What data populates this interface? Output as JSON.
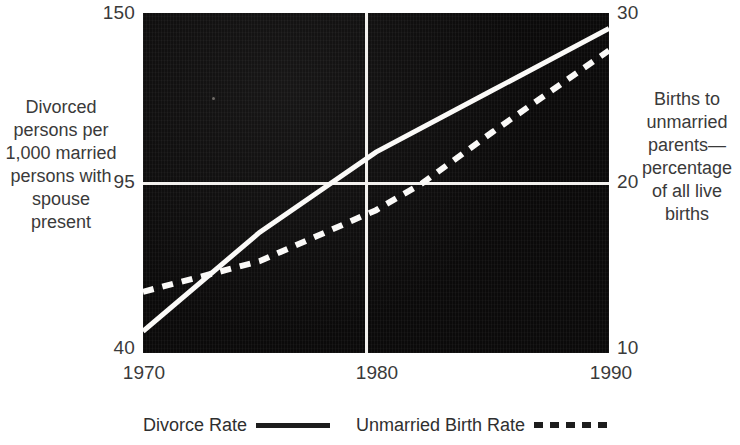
{
  "chart_data": {
    "type": "line",
    "title": "",
    "subtitle": "",
    "xlabel": "",
    "x_ticks": [
      "1970",
      "1980",
      "1990"
    ],
    "x_values": [
      1970,
      1980,
      1990
    ],
    "xlim": [
      1970,
      1990
    ],
    "grid": true,
    "grid_lines": {
      "vertical_at_x": 1980,
      "horizontal_at_left_y": 95,
      "horizontal_at_right_y": 20
    },
    "legend_position": "bottom",
    "axes": {
      "left": {
        "label": "Divorced persons per 1,000 married persons with spouse present",
        "ticks": [
          "150",
          "95",
          "40"
        ],
        "tick_values": [
          150,
          95,
          40
        ],
        "ylim": [
          40,
          150
        ]
      },
      "right": {
        "label": "Births to unmarried parents—percentage of all live births",
        "ticks": [
          "30",
          "20",
          "10"
        ],
        "tick_values": [
          30,
          20,
          10
        ],
        "ylim": [
          10,
          30
        ]
      }
    },
    "series": [
      {
        "name": "Divorce Rate",
        "axis": "left",
        "style": "solid",
        "color": "#fbfaf8",
        "x": [
          1970,
          1975,
          1980,
          1985,
          1990
        ],
        "values": [
          47,
          79,
          105,
          125,
          145
        ]
      },
      {
        "name": "Unmarried Birth Rate",
        "axis": "right",
        "style": "dashed",
        "color": "#fbfaf8",
        "x": [
          1970,
          1975,
          1980,
          1982,
          1985,
          1990
        ],
        "values": [
          13.6,
          15.4,
          18.4,
          20.0,
          23.0,
          27.8
        ]
      }
    ],
    "plot_background_color": "#0b0a0a",
    "line_color": "#fbfaf8"
  },
  "axis_titles": {
    "left": "Divorced persons per 1,000 married persons with spouse present",
    "right": "Births to unmarried parents—percentage of all live births"
  },
  "ticks": {
    "left_top": "150",
    "left_mid": "95",
    "left_bottom": "40",
    "right_top": "30",
    "right_mid": "20",
    "right_bottom": "10",
    "x_first": "1970",
    "x_second": "1980",
    "x_third": "1990"
  },
  "legend": {
    "entries": [
      {
        "label": "Divorce Rate",
        "style": "solid"
      },
      {
        "label": "Unmarried Birth Rate",
        "style": "dashed"
      }
    ]
  }
}
